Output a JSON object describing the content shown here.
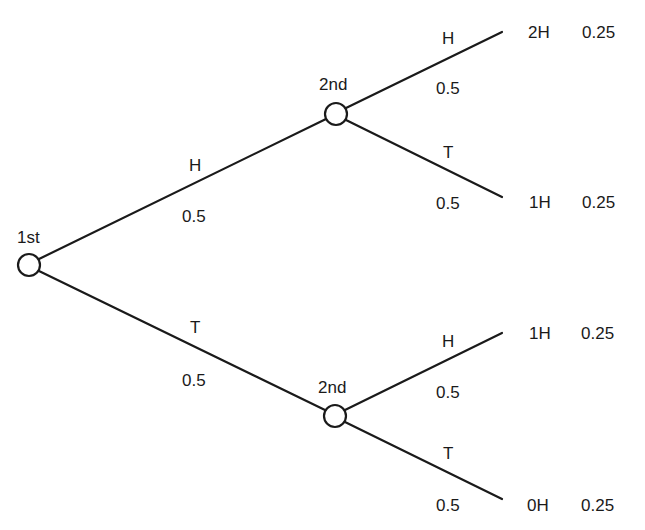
{
  "diagram": {
    "type": "probability-tree",
    "stroke_color": "#1a1a1a",
    "root": {
      "label": "1st"
    },
    "second_nodes": [
      {
        "label": "2nd"
      },
      {
        "label": "2nd"
      }
    ],
    "first_branches": [
      {
        "outcome": "H",
        "prob": "0.5"
      },
      {
        "outcome": "T",
        "prob": "0.5"
      }
    ],
    "second_branches": [
      {
        "outcome": "H",
        "prob": "0.5",
        "result": "2H",
        "joint_prob": "0.25"
      },
      {
        "outcome": "T",
        "prob": "0.5",
        "result": "1H",
        "joint_prob": "0.25"
      },
      {
        "outcome": "H",
        "prob": "0.5",
        "result": "1H",
        "joint_prob": "0.25"
      },
      {
        "outcome": "T",
        "prob": "0.5",
        "result": "0H",
        "joint_prob": "0.25"
      }
    ]
  }
}
